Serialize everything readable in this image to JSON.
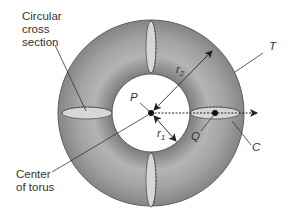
{
  "colors": {
    "torus_fill": "#8a8a8a",
    "torus_highlight": "#c9c9c9",
    "cross_section_fill": "#d8d8d8",
    "line": "#333333",
    "background": "#ffffff"
  },
  "labels": {
    "cross_section_line1": "Circular",
    "cross_section_line2": "cross",
    "cross_section_line3": "section",
    "center_line1": "Center",
    "center_line2": "of torus",
    "T": "T",
    "P": "P",
    "Q": "Q",
    "C": "C",
    "r1_base": "r",
    "r1_sub": "1",
    "r2_base": "r",
    "r2_sub": "2"
  },
  "geometry": {
    "center": [
      151,
      113
    ],
    "outer_radius": 93,
    "inner_radius": 39,
    "tube_center_radius": 64
  }
}
